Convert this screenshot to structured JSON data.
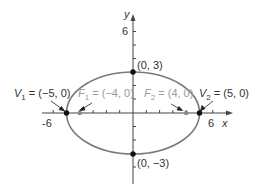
{
  "diagram": {
    "type": "ellipse",
    "equation_hint": "x^2/25 + y^2/9 = 1",
    "axes": {
      "x_label": "x",
      "y_label": "y",
      "x_ticks_labeled": [
        "-6",
        "6"
      ],
      "y_ticks_labeled": [
        "6"
      ]
    },
    "points": {
      "top": {
        "label": "(0, 3)",
        "x": 0,
        "y": 3
      },
      "bottom": {
        "label": "(0, −3)",
        "x": 0,
        "y": -3
      },
      "v1": {
        "name": "V",
        "sub": "1",
        "value": " = (−5,  0)",
        "x": -5,
        "y": 0
      },
      "v2": {
        "name": "V",
        "sub": "2",
        "value": " = (5, 0)",
        "x": 5,
        "y": 0
      },
      "f1": {
        "name": "F",
        "sub": "1",
        "value": " = (−4, 0)",
        "x": -4,
        "y": 0
      },
      "f2": {
        "name": "F",
        "sub": "2",
        "value": " = (4, 0)",
        "x": 4,
        "y": 0
      }
    },
    "colors": {
      "ellipse": "#7a7a7a",
      "axis": "#444444",
      "vertex": "#111111",
      "focus": "#8a8a8a"
    }
  }
}
